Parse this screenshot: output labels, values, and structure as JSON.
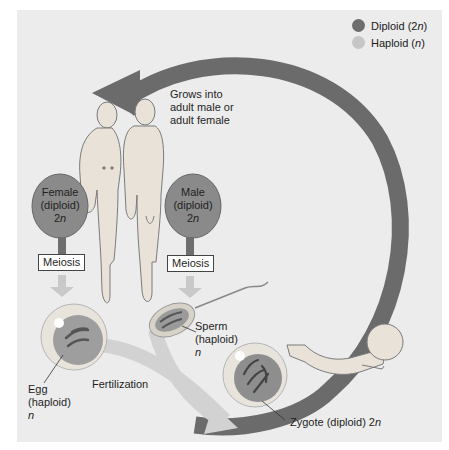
{
  "legend": {
    "diploid": {
      "label": "Diploid (2",
      "italic": "n",
      "suffix": ")",
      "color": "#6e6e6e"
    },
    "haploid": {
      "label": "Haploid (",
      "italic": "n",
      "suffix": ")",
      "color": "#c6c6c6"
    }
  },
  "grows_label": {
    "line1": "Grows into",
    "line2": "adult male or",
    "line3": "adult female"
  },
  "female": {
    "line1": "Female",
    "line2": "(diploid)",
    "line3": "2",
    "italic": "n"
  },
  "male": {
    "line1": "Male",
    "line2": "(diploid)",
    "line3": "2",
    "italic": "n"
  },
  "meiosis_female": "Meiosis",
  "meiosis_male": "Meiosis",
  "sperm": {
    "line1": "Sperm",
    "line2": "(haploid)",
    "italic": "n"
  },
  "egg": {
    "line1": "Egg",
    "line2": "(haploid)",
    "italic": "n"
  },
  "fertilization": "Fertilization",
  "zygote": {
    "label": "Zygote (diploid) 2",
    "italic": "n"
  },
  "colors": {
    "diploid": "#6e6e6e",
    "haploid": "#c6c6c6",
    "background": "#ececec"
  }
}
